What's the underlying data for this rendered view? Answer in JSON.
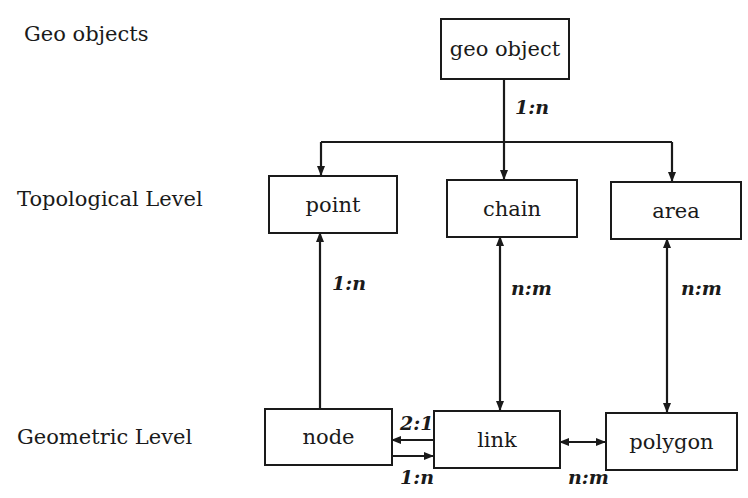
{
  "levels": {
    "geo_objects": "Geo objects",
    "topological": "Topological Level",
    "geometric": "Geometric Level"
  },
  "entities": {
    "geo_object": "geo object",
    "point": "point",
    "chain": "chain",
    "area": "area",
    "node": "node",
    "link": "link",
    "polygon": "polygon"
  },
  "relations": {
    "geo_object_to_topology": "1:n",
    "node_to_point": "1:n",
    "chain_link": "n:m",
    "area_polygon": "n:m",
    "link_to_node": "2:1",
    "node_to_link": "1:n",
    "link_polygon": "n:m"
  }
}
